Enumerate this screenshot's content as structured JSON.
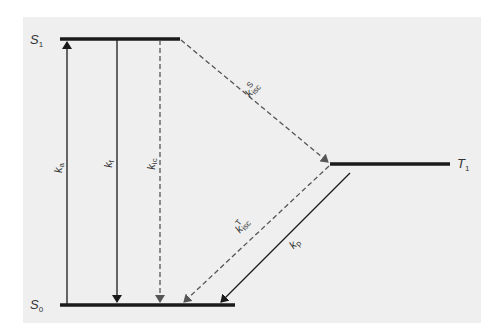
{
  "diagram": {
    "type": "jablonski",
    "colors": {
      "background": "#efefef",
      "solid": "#1a1a1a",
      "dashed": "#555555"
    },
    "states": [
      {
        "id": "S1",
        "symbol": "S",
        "sub": "1"
      },
      {
        "id": "S0",
        "symbol": "S",
        "sub": "0"
      },
      {
        "id": "T1",
        "symbol": "T",
        "sub": "1"
      }
    ],
    "transitions": [
      {
        "id": "ka",
        "symbol": "k",
        "sub": "a",
        "sup": "",
        "from": "S0",
        "to": "S1",
        "style": "solid"
      },
      {
        "id": "kf",
        "symbol": "k",
        "sub": "f",
        "sup": "",
        "from": "S1",
        "to": "S0",
        "style": "solid"
      },
      {
        "id": "kic",
        "symbol": "k",
        "sub": "ic",
        "sup": "",
        "from": "S1",
        "to": "S0",
        "style": "dashed"
      },
      {
        "id": "kisc_S",
        "symbol": "k",
        "sub": "isc",
        "sup": "S",
        "from": "S1",
        "to": "T1",
        "style": "dashed"
      },
      {
        "id": "kisc_T",
        "symbol": "k",
        "sub": "isc",
        "sup": "T",
        "from": "T1",
        "to": "S0",
        "style": "dashed"
      },
      {
        "id": "kp",
        "symbol": "k",
        "sub": "p",
        "sup": "",
        "from": "T1",
        "to": "S0",
        "style": "solid"
      }
    ]
  }
}
